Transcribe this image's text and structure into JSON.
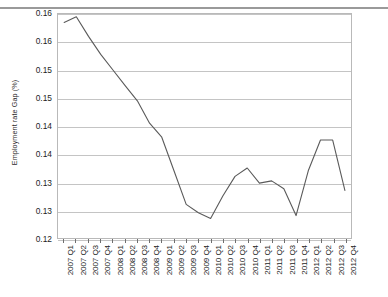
{
  "chart_data": {
    "type": "line",
    "title": "",
    "subtitle": "",
    "xlabel": "",
    "ylabel": "Employment rate Gap (%)",
    "grid": true,
    "legend": false,
    "legend_position": "none",
    "line_color": "#5a5a5a",
    "x": [
      "2007 Q1",
      "2007 Q2",
      "2007 Q3",
      "2007 Q4",
      "2008 Q1",
      "2008 Q2",
      "2008 Q3",
      "2008 Q4",
      "2009 Q1",
      "2009 Q2",
      "2009 Q3",
      "2009 Q4",
      "2010 Q1",
      "2010 Q2",
      "2010 Q3",
      "2010 Q4",
      "2011 Q1",
      "2011 Q2",
      "2011 Q3",
      "2011 Q4",
      "2012 Q1",
      "2012 Q2",
      "2012 Q3",
      "2012 Q4"
    ],
    "values": [
      0.1635,
      0.1645,
      0.161,
      0.1578,
      0.155,
      0.1522,
      0.1495,
      0.1455,
      0.143,
      0.137,
      0.131,
      0.1295,
      0.1285,
      0.1325,
      0.136,
      0.1375,
      0.1348,
      0.1352,
      0.1338,
      0.129,
      0.137,
      0.1425,
      0.1425,
      0.1335
    ],
    "categories": [
      "2007 Q1",
      "2007 Q2",
      "2007 Q3",
      "2007 Q4",
      "2008 Q1",
      "2008 Q2",
      "2008 Q3",
      "2008 Q4",
      "2009 Q1",
      "2009 Q2",
      "2009 Q3",
      "2009 Q4",
      "2010 Q1",
      "2010 Q2",
      "2010 Q3",
      "2010 Q4",
      "2011 Q1",
      "2011 Q2",
      "2011 Q3",
      "2011 Q4",
      "2012 Q1",
      "2012 Q2",
      "2012 Q3",
      "2012 Q4"
    ],
    "ylim": [
      0.125,
      0.165
    ],
    "ytick_values": [
      0.125,
      0.13,
      0.135,
      0.14,
      0.145,
      0.15,
      0.155,
      0.16,
      0.165
    ],
    "ytick_labels": [
      "0.12",
      "0.13",
      "0.13",
      "0.14",
      "0.14",
      "0.15",
      "0.15",
      "0.16",
      "0.16"
    ],
    "series": [
      {
        "name": "Employment rate Gap (%)",
        "values": [
          0.1635,
          0.1645,
          0.161,
          0.1578,
          0.155,
          0.1522,
          0.1495,
          0.1455,
          0.143,
          0.137,
          0.131,
          0.1295,
          0.1285,
          0.1325,
          0.136,
          0.1375,
          0.1348,
          0.1352,
          0.1338,
          0.129,
          0.137,
          0.1425,
          0.1425,
          0.1335
        ]
      }
    ]
  }
}
